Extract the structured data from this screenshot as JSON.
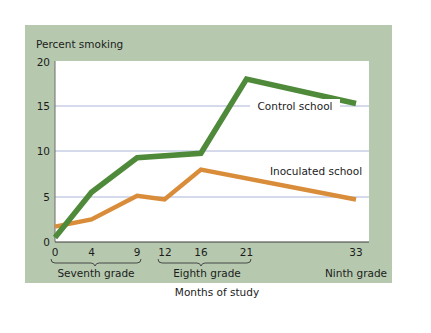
{
  "chart_data": {
    "type": "line",
    "title": "",
    "ylabel": "Percent smoking",
    "xlabel": "Months of study",
    "ylim": [
      0,
      20
    ],
    "xlim": [
      0,
      33
    ],
    "yticks": [
      "0",
      "5",
      "10",
      "15",
      "20"
    ],
    "xticks": [
      "0",
      "4",
      "9",
      "12",
      "16",
      "21",
      "33"
    ],
    "grid": "horizontal",
    "grade_groups": [
      {
        "label": "Seventh grade",
        "from": 0,
        "to": 9
      },
      {
        "label": "Eighth grade",
        "from": 12,
        "to": 21
      },
      {
        "label": "Ninth grade",
        "at": 33
      }
    ],
    "series": [
      {
        "name": "Control school",
        "color": "#4f8a3a",
        "points": [
          [
            0,
            0.5
          ],
          [
            4,
            5.5
          ],
          [
            9,
            9.3
          ],
          [
            16,
            9.8
          ],
          [
            21,
            18.0
          ],
          [
            33,
            15.3
          ]
        ]
      },
      {
        "name": "Inoculated school",
        "color": "#d98c3a",
        "points": [
          [
            0,
            1.7
          ],
          [
            4,
            2.5
          ],
          [
            9,
            5.1
          ],
          [
            12,
            4.7
          ],
          [
            16,
            8.0
          ],
          [
            33,
            4.7
          ]
        ]
      }
    ],
    "legend": "inline labels near lines"
  },
  "labels": {
    "ylabel": "Percent smoking",
    "xlabel": "Months of study",
    "control": "Control school",
    "inoculated": "Inoculated school",
    "seventh": "Seventh grade",
    "eighth": "Eighth grade",
    "ninth": "Ninth grade",
    "y0": "0",
    "y5": "5",
    "y10": "10",
    "y15": "15",
    "y20": "20",
    "x0": "0",
    "x4": "4",
    "x9": "9",
    "x12": "12",
    "x16": "16",
    "x21": "21",
    "x33": "33"
  },
  "colors": {
    "panel": "#b6c9af",
    "plot": "#ffffff",
    "grid": "#aab4d8",
    "control": "#4f8a3a",
    "inoculated": "#d98c3a"
  }
}
